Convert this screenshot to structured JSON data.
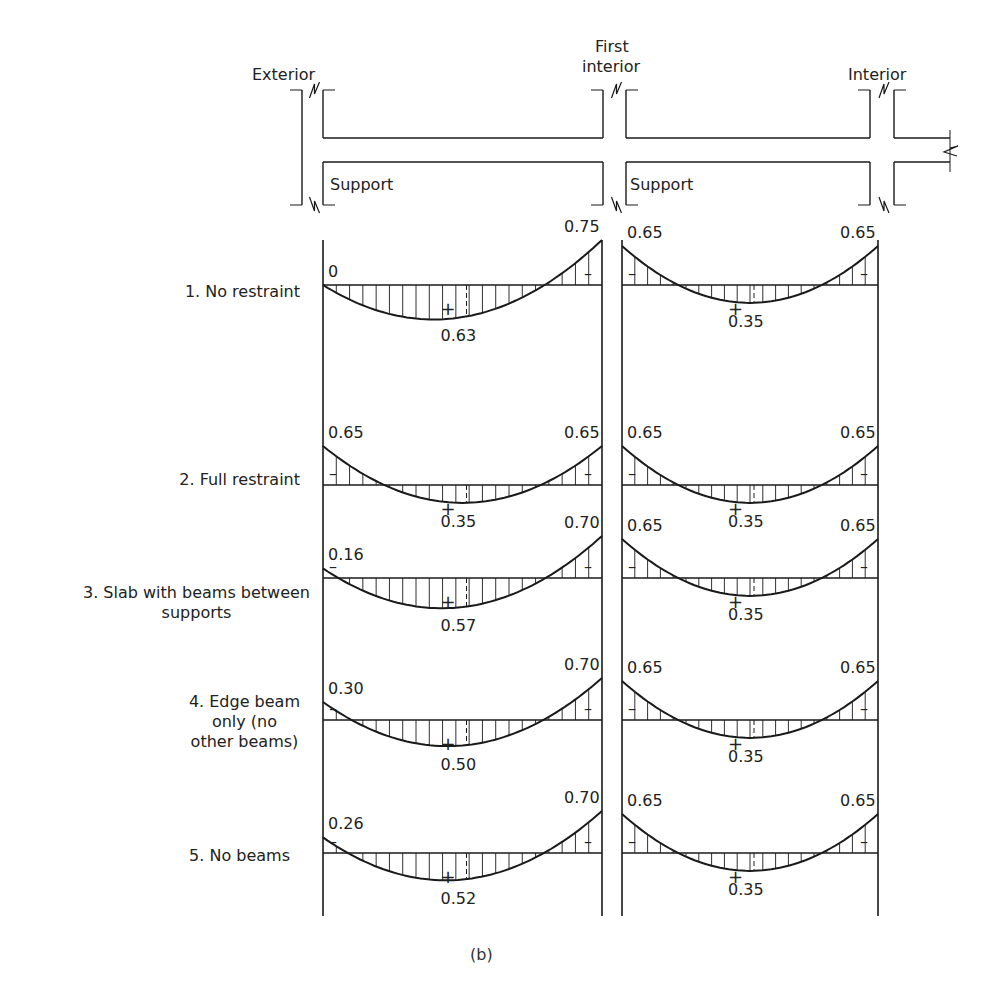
{
  "structure": {
    "supports": [
      {
        "label_lines": [
          "Exterior"
        ],
        "x": 323,
        "label_x": 283,
        "label_y": 22
      },
      {
        "label_lines": [
          "First",
          "interior"
        ],
        "x": 612,
        "label_x": 612,
        "label_y": 12
      },
      {
        "label_lines": [
          "Interior"
        ],
        "x": 878,
        "label_x": 878,
        "label_y": 22
      }
    ],
    "support_text": [
      {
        "text": "Support",
        "x": 330,
        "y": 190
      },
      {
        "text": "Support",
        "x": 630,
        "y": 190
      }
    ]
  },
  "cases": [
    {
      "label_lines": [
        "1. No restraint"
      ],
      "label_right": 300,
      "label_top": 292,
      "left_span": {
        "start": 0.0,
        "mid": 0.63,
        "end": 0.75,
        "start_label": "0",
        "mid_label": "0.63",
        "end_label": "0.75"
      },
      "right_span": {
        "start": 0.65,
        "mid": 0.35,
        "end": 0.65,
        "start_label": "0.65",
        "mid_label": "0.35",
        "end_label": "0.65"
      }
    },
    {
      "label_lines": [
        "2. Full restraint"
      ],
      "label_right": 300,
      "label_top": 470,
      "left_span": {
        "start": 0.65,
        "mid": 0.35,
        "end": 0.65,
        "start_label": "0.65",
        "mid_label": "0.35",
        "end_label": "0.65"
      },
      "right_span": {
        "start": 0.65,
        "mid": 0.35,
        "end": 0.65,
        "start_label": "0.65",
        "mid_label": "0.35",
        "end_label": "0.65"
      }
    },
    {
      "label_lines": [
        "3. Slab with beams between",
        "supports"
      ],
      "label_right": 310,
      "label_top": 582,
      "left_span": {
        "start": 0.16,
        "mid": 0.57,
        "end": 0.7,
        "start_label": "0.16",
        "mid_label": "0.57",
        "end_label": "0.70"
      },
      "right_span": {
        "start": 0.65,
        "mid": 0.35,
        "end": 0.65,
        "start_label": "0.65",
        "mid_label": "0.35",
        "end_label": "0.65"
      }
    },
    {
      "label_lines": [
        "4. Edge beam",
        "only (no",
        "other beams)"
      ],
      "label_right": 300,
      "label_top": 693,
      "left_span": {
        "start": 0.3,
        "mid": 0.5,
        "end": 0.7,
        "start_label": "0.30",
        "mid_label": "0.50",
        "end_label": "0.70"
      },
      "right_span": {
        "start": 0.65,
        "mid": 0.35,
        "end": 0.65,
        "start_label": "0.65",
        "mid_label": "0.35",
        "end_label": "0.65"
      }
    },
    {
      "label_lines": [
        "5. No beams"
      ],
      "label_right": 290,
      "label_top": 846,
      "left_span": {
        "start": 0.26,
        "mid": 0.52,
        "end": 0.7,
        "start_label": "0.26",
        "mid_label": "0.52",
        "end_label": "0.70"
      },
      "right_span": {
        "start": 0.65,
        "mid": 0.35,
        "end": 0.65,
        "start_label": "0.65",
        "mid_label": "0.35",
        "end_label": "0.65"
      }
    }
  ],
  "signs": {
    "positive": "+",
    "negative": "–"
  },
  "caption": "(b)",
  "colors": {
    "ink": "#1a1a1a",
    "paper": "#ffffff"
  }
}
